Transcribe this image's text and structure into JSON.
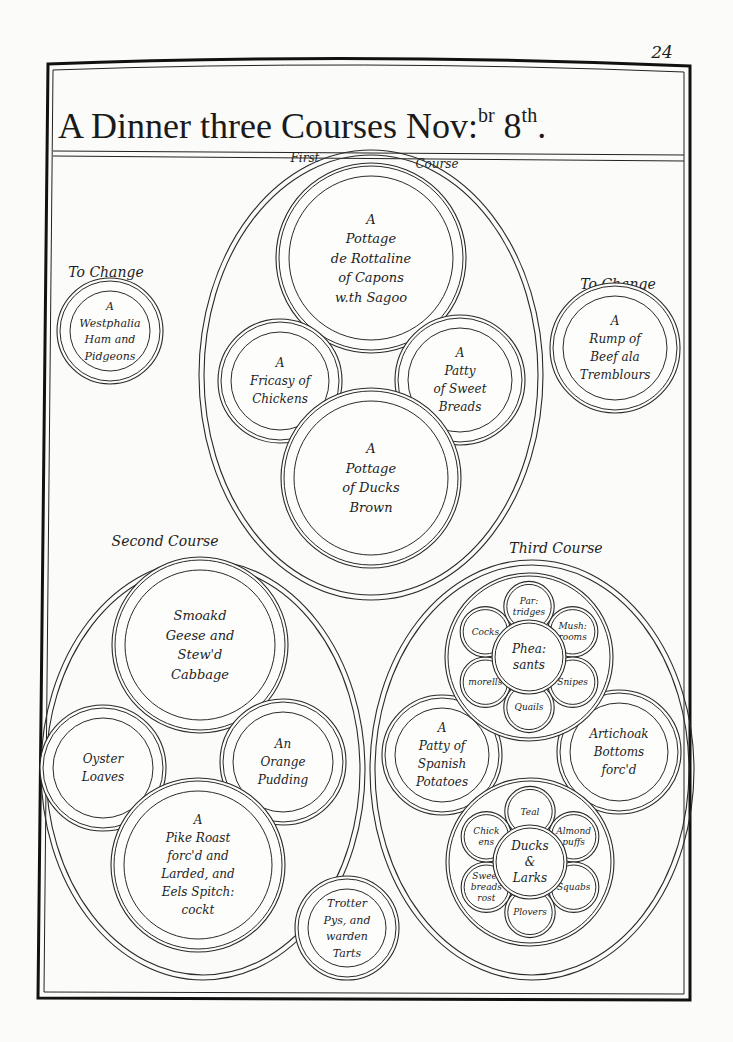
{
  "page_number": "24",
  "title": {
    "main": "A Dinner three Courses Nov:",
    "sup1": "br",
    "day": " 8",
    "sup2": "th",
    "end": "."
  },
  "labels": {
    "first_course_a": "First",
    "first_course_b": "Course",
    "to_change_left": "To Change",
    "to_change_right": "To Change",
    "second_course": "Second Course",
    "third_course": "Third Course"
  },
  "first_course": {
    "top": [
      "A",
      "Pottage",
      "de Rottaline",
      "of Capons",
      "w.th Sagoo"
    ],
    "left": [
      "A",
      "Fricasy of",
      "Chickens"
    ],
    "right": [
      "A",
      "Patty",
      "of Sweet",
      "Breads"
    ],
    "bottom": [
      "A",
      "Pottage",
      "of Ducks",
      "Brown"
    ]
  },
  "removes": {
    "left": [
      "A",
      "Westphalia",
      "Ham and",
      "Pidgeons"
    ],
    "right": [
      "A",
      "Rump of",
      "Beef ala",
      "Tremblours"
    ]
  },
  "second_course": {
    "top": [
      "Smoakd",
      "Geese and",
      "Stew'd",
      "Cabbage"
    ],
    "left": [
      "Oyster",
      "Loaves"
    ],
    "right": [
      "An",
      "Orange",
      "Pudding"
    ],
    "bottom": [
      "A",
      "Pike Roast",
      "forc'd and",
      "Larded, and",
      "Eels Spitch:",
      "cockt"
    ]
  },
  "third_course": {
    "top_cluster": {
      "center": [
        "Phea:",
        "sants"
      ],
      "petals": [
        {
          "pos": "top",
          "lines": [
            "Par:",
            "tridges"
          ]
        },
        {
          "pos": "upper-right",
          "lines": [
            "Mush:",
            "rooms"
          ]
        },
        {
          "pos": "lower-right",
          "lines": [
            "Snipes"
          ]
        },
        {
          "pos": "bottom",
          "lines": [
            "Quails"
          ]
        },
        {
          "pos": "lower-left",
          "lines": [
            "morells"
          ]
        },
        {
          "pos": "upper-left",
          "lines": [
            "Cocks"
          ]
        }
      ]
    },
    "left": [
      "A",
      "Patty of",
      "Spanish",
      "Potatoes"
    ],
    "right": [
      "Artichoak",
      "Bottoms",
      "forc'd"
    ],
    "bottom_cluster": {
      "center": [
        "Ducks",
        "&",
        "Larks"
      ],
      "petals": [
        {
          "pos": "top",
          "lines": [
            "Teal"
          ]
        },
        {
          "pos": "upper-right",
          "lines": [
            "Almond",
            "puffs"
          ]
        },
        {
          "pos": "lower-right",
          "lines": [
            "Squabs"
          ]
        },
        {
          "pos": "bottom",
          "lines": [
            "Plovers"
          ]
        },
        {
          "pos": "lower-left",
          "lines": [
            "Sweet",
            "breads",
            "rost"
          ]
        },
        {
          "pos": "upper-left",
          "lines": [
            "Chick",
            "ens"
          ]
        }
      ]
    }
  },
  "centre_bottom": [
    "Trotter",
    "Pys, and",
    "warden",
    "Tarts"
  ]
}
